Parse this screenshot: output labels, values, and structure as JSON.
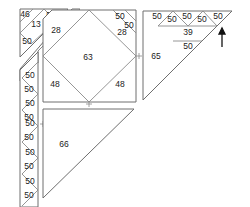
{
  "diagram": {
    "corner_triangle": {
      "labels": {
        "top_left": "46",
        "top_right": "50",
        "center": "13",
        "bottom": "50"
      }
    },
    "strip_top": {
      "label": "28"
    },
    "vertical_strip": {
      "labels": [
        "50",
        "50",
        "50",
        "50",
        "50",
        "50",
        "50",
        "50",
        "50",
        "50"
      ]
    },
    "square_block": {
      "center": "63",
      "top_left_corner": "28",
      "top_right_corner_a": "50",
      "top_right_corner_b": "50",
      "top_right_corner_c": "28",
      "bottom_left": "48",
      "bottom_right": "48"
    },
    "right_triangle": {
      "main": "65",
      "top_row": [
        "50",
        "50",
        "50",
        "50",
        "50"
      ],
      "middle": "39",
      "bottom": "50"
    },
    "bottom_triangle": {
      "label": "66"
    },
    "arrow": {
      "direction": "up",
      "color": "#111111"
    },
    "colors": {
      "line": "#8a8a8a",
      "text": "#222222",
      "background": "#ffffff"
    }
  }
}
